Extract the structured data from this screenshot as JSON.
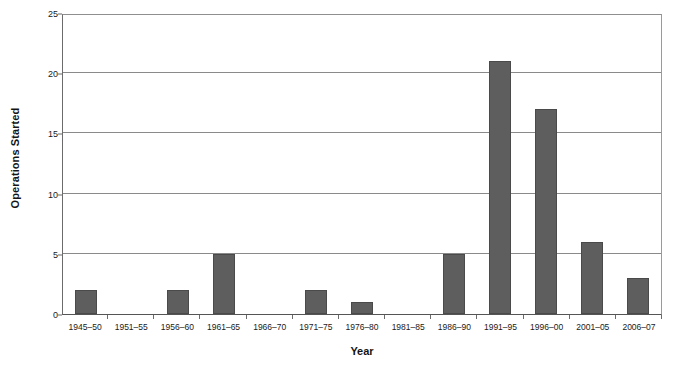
{
  "chart_data": {
    "type": "bar",
    "title": "",
    "xlabel": "Year",
    "ylabel": "Operations Started",
    "categories": [
      "1945–50",
      "1951–55",
      "1956–60",
      "1961–65",
      "1966–70",
      "1971–75",
      "1976–80",
      "1981–85",
      "1986–90",
      "1991–95",
      "1996–00",
      "2001–05",
      "2006–07"
    ],
    "values": [
      2,
      0,
      2,
      5,
      0,
      2,
      1,
      0,
      5,
      21,
      17,
      6,
      3
    ],
    "ylim": [
      0,
      25
    ],
    "yticks": [
      0,
      5,
      10,
      15,
      20,
      25
    ],
    "ytick_labels": [
      "0",
      "5",
      "10",
      "15",
      "20",
      "25"
    ],
    "grid": true,
    "grid_axis": "y",
    "legend": false,
    "legend_position": "none",
    "bar_color": "#5e5e5e",
    "bar_edge_color": "#4a4a4a",
    "grid_color": "#8a8a8a",
    "axis_color": "#6b6b6b",
    "background_color": "#ffffff",
    "text_color": "#1a1a1a"
  },
  "axes": {
    "y_title": "Operations Started",
    "x_title": "Year"
  }
}
